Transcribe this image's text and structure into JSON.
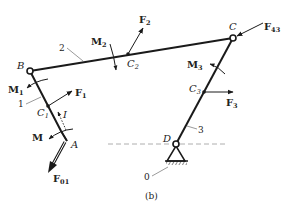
{
  "figure": {
    "caption": "(b)",
    "joints": {
      "B": "B",
      "C": "C",
      "D": "D",
      "A": "A"
    },
    "centers": {
      "C1": {
        "base": "C",
        "sub": "1"
      },
      "C2": {
        "base": "C",
        "sub": "2"
      },
      "C3": {
        "base": "C",
        "sub": "3"
      }
    },
    "links": {
      "link0": "0",
      "link1": "1",
      "link2": "2",
      "link3": "3"
    },
    "forces": {
      "F1": {
        "base": "F",
        "sub": "1"
      },
      "F2": {
        "base": "F",
        "sub": "2"
      },
      "F3": {
        "base": "F",
        "sub": "3"
      },
      "F43": {
        "base": "F",
        "sub": "43"
      },
      "F01": {
        "base": "F",
        "sub": "01"
      }
    },
    "moments": {
      "M": {
        "base": "M",
        "sub": ""
      },
      "M1": {
        "base": "M",
        "sub": "1"
      },
      "M2": {
        "base": "M",
        "sub": "2"
      },
      "M3": {
        "base": "M",
        "sub": "3"
      }
    },
    "other_labels": {
      "I": "I"
    },
    "colors": {
      "ink": "#1a1a1a",
      "dashed_line": "#9a9a9a",
      "background": "#ffffff"
    }
  }
}
